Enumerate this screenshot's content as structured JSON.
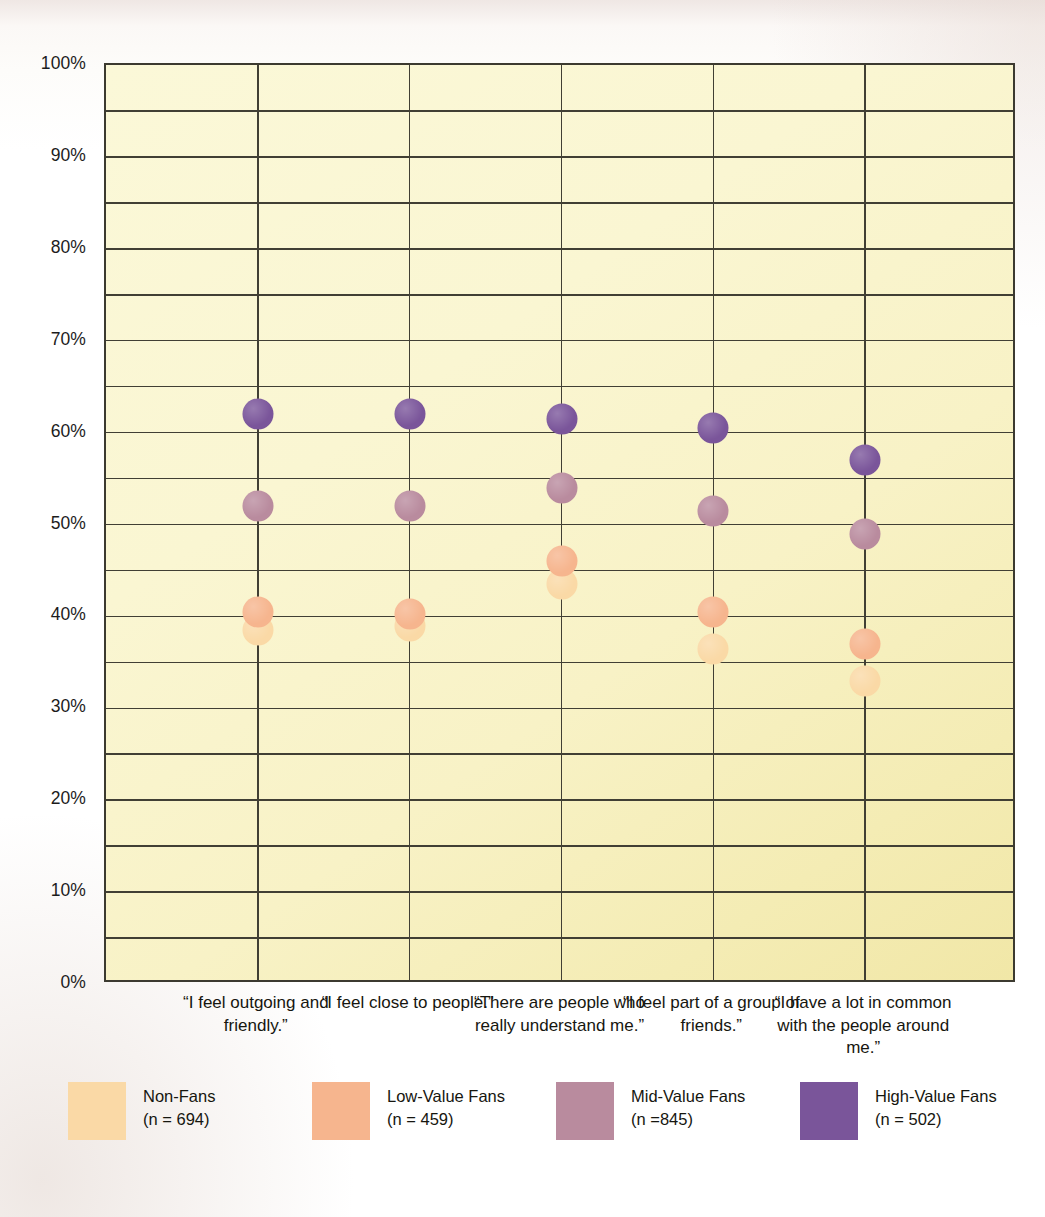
{
  "chart_data": {
    "type": "scatter",
    "title": "",
    "xlabel": "",
    "ylabel": "",
    "ylim": [
      0,
      100
    ],
    "y_unit": "%",
    "grid": true,
    "legend_position": "bottom",
    "y_ticks": [
      "100%",
      "90%",
      "80%",
      "70%",
      "60%",
      "50%",
      "40%",
      "30%",
      "20%",
      "10%",
      "0%"
    ],
    "y_tick_values": [
      100,
      90,
      80,
      70,
      60,
      50,
      40,
      30,
      20,
      10,
      0
    ],
    "minor_gridline_step": 5,
    "categories": [
      "“I feel outgoing and friendly.”",
      "“I feel close to people.”",
      "“There are people who really understand me.”",
      "“I feel part of a group of friends.”",
      "“I have a lot in common with the people around me.”"
    ],
    "series": [
      {
        "name": "Non-Fans",
        "n_label": "(n = 694)",
        "color": "#fad9a6",
        "values": [
          38.5,
          39.0,
          43.5,
          36.5,
          33.0
        ]
      },
      {
        "name": "Low-Value Fans",
        "n_label": "(n = 459)",
        "color": "#f6b58e",
        "values": [
          40.5,
          40.3,
          46.0,
          40.5,
          37.0
        ]
      },
      {
        "name": "Mid-Value Fans",
        "n_label": "(n =845)",
        "color": "#b98b9e",
        "values": [
          52.0,
          52.0,
          54.0,
          51.5,
          49.0
        ]
      },
      {
        "name": "High-Value Fans",
        "n_label": "(n = 502)",
        "color": "#7a559a",
        "values": [
          62.0,
          62.0,
          61.5,
          60.5,
          57.0
        ]
      }
    ]
  },
  "plot": {
    "background_color": "#f9f5cd",
    "gridline_color": "#413f34",
    "border_color": "#3c3a30"
  },
  "legend": {
    "items": [
      {
        "label": "Non-Fans",
        "n": "(n = 694)",
        "color": "#fad9a6"
      },
      {
        "label": "Low-Value Fans",
        "n": "(n = 459)",
        "color": "#f6b58e"
      },
      {
        "label": "Mid-Value Fans",
        "n": "(n =845)",
        "color": "#b98b9e"
      },
      {
        "label": "High-Value Fans",
        "n": "(n = 502)",
        "color": "#7a559a"
      }
    ]
  }
}
